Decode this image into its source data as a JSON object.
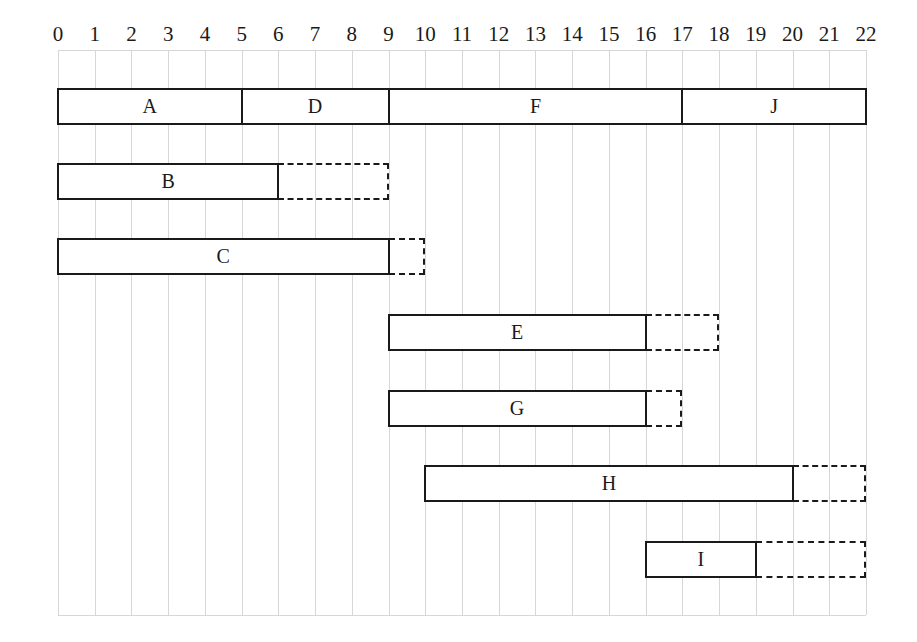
{
  "chart_data": {
    "type": "gantt",
    "title": "",
    "xlabel": "",
    "ylabel": "",
    "xlim": [
      0,
      22
    ],
    "x_ticks": [
      0,
      1,
      2,
      3,
      4,
      5,
      6,
      7,
      8,
      9,
      10,
      11,
      12,
      13,
      14,
      15,
      16,
      17,
      18,
      19,
      20,
      21,
      22
    ],
    "grid": true,
    "legend": null,
    "rows": [
      {
        "tasks": [
          {
            "label": "A",
            "start": 0,
            "end": 5,
            "slack_end": null
          },
          {
            "label": "D",
            "start": 5,
            "end": 9,
            "slack_end": null
          },
          {
            "label": "F",
            "start": 9,
            "end": 17,
            "slack_end": null
          },
          {
            "label": "J",
            "start": 17,
            "end": 22,
            "slack_end": null
          }
        ]
      },
      {
        "tasks": [
          {
            "label": "B",
            "start": 0,
            "end": 6,
            "slack_end": 9
          }
        ]
      },
      {
        "tasks": [
          {
            "label": "C",
            "start": 0,
            "end": 9,
            "slack_end": 10
          }
        ]
      },
      {
        "tasks": [
          {
            "label": "E",
            "start": 9,
            "end": 16,
            "slack_end": 18
          }
        ]
      },
      {
        "tasks": [
          {
            "label": "G",
            "start": 9,
            "end": 16,
            "slack_end": 17
          }
        ]
      },
      {
        "tasks": [
          {
            "label": "H",
            "start": 10,
            "end": 20,
            "slack_end": 22
          }
        ]
      },
      {
        "tasks": [
          {
            "label": "I",
            "start": 16,
            "end": 19,
            "slack_end": 22
          }
        ]
      }
    ]
  }
}
